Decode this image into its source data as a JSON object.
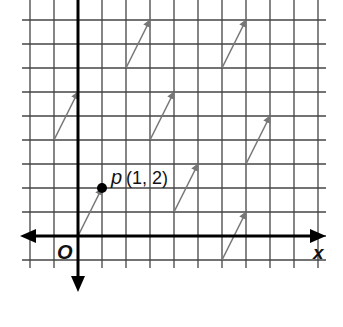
{
  "diagram": {
    "grid": {
      "origin_px": [
        78,
        236
      ],
      "unit_px": 24,
      "x_min": -2,
      "x_max": 10,
      "y_min": -1,
      "y_max": 9,
      "line_color": "#444444"
    },
    "axes": {
      "x_label": "x",
      "origin_label": "O",
      "color": "#000000"
    },
    "point": {
      "name": "p",
      "coords_label": "(1, 2)",
      "x": 1,
      "y": 2
    },
    "vectors": [
      {
        "from": [
          0,
          0
        ],
        "to": [
          1,
          2
        ]
      },
      {
        "from": [
          -1,
          4
        ],
        "to": [
          0,
          6
        ]
      },
      {
        "from": [
          2,
          7
        ],
        "to": [
          3,
          9
        ]
      },
      {
        "from": [
          3,
          4
        ],
        "to": [
          4,
          6
        ]
      },
      {
        "from": [
          6,
          7
        ],
        "to": [
          7,
          9
        ]
      },
      {
        "from": [
          4,
          1
        ],
        "to": [
          5,
          3
        ]
      },
      {
        "from": [
          7,
          3
        ],
        "to": [
          8,
          5
        ]
      },
      {
        "from": [
          6,
          -1
        ],
        "to": [
          7,
          1
        ]
      }
    ],
    "vector_color": "#777777"
  }
}
